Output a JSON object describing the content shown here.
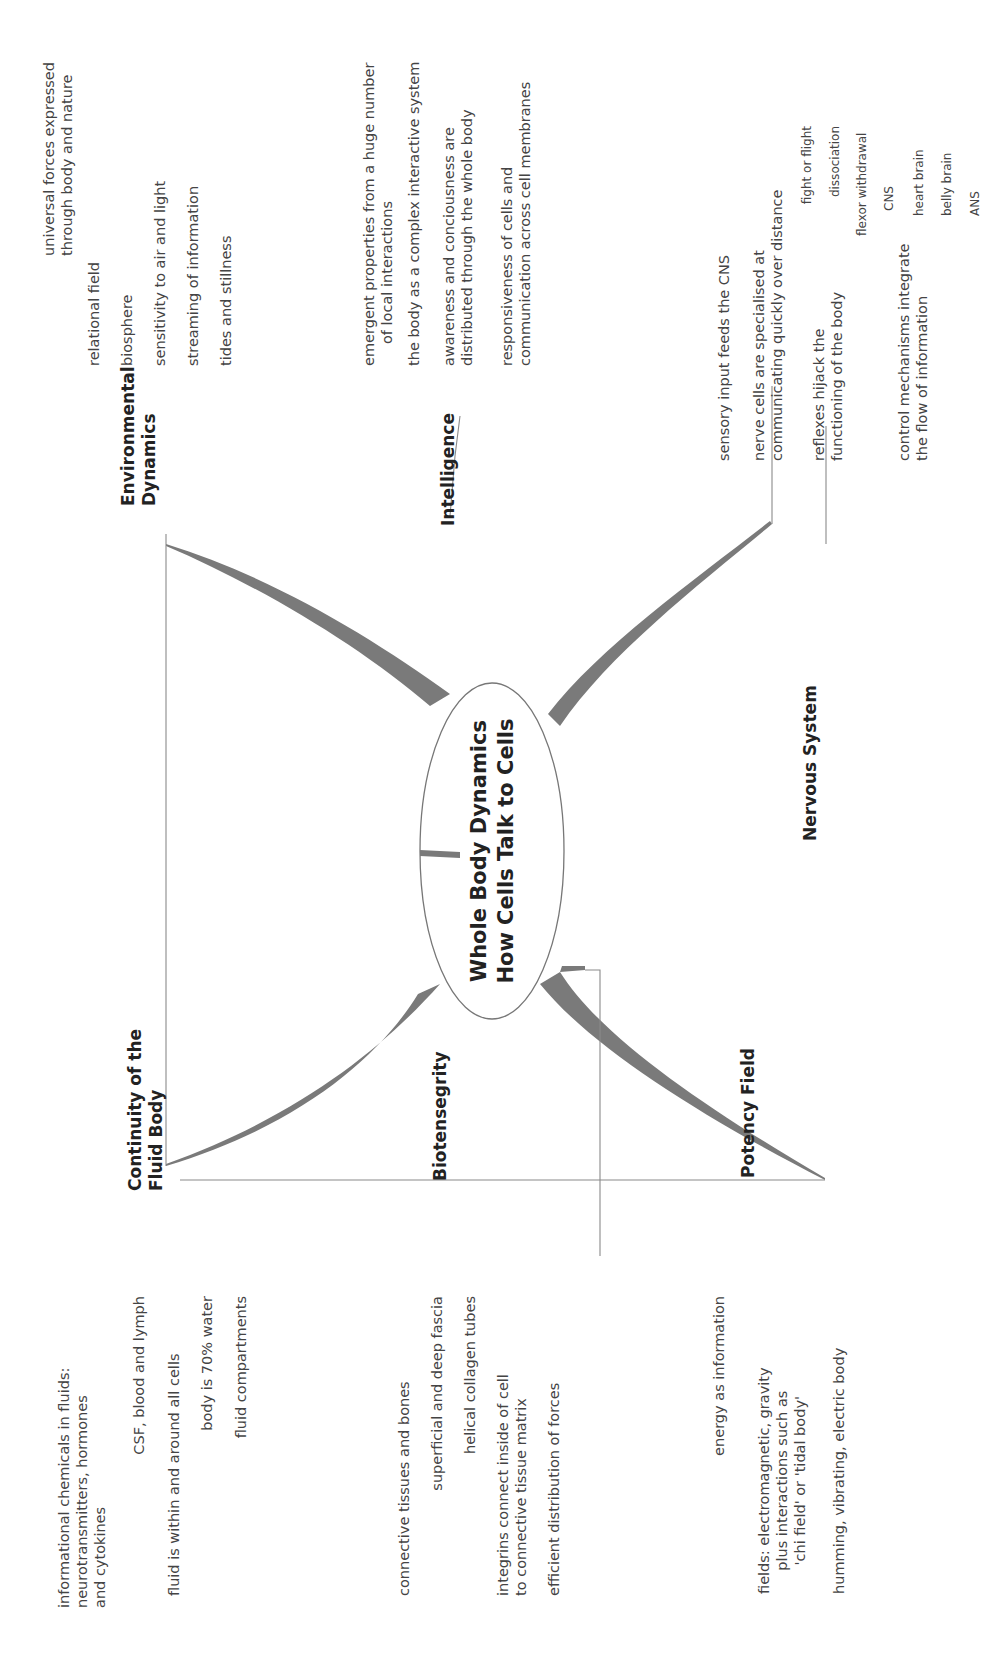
{
  "central": {
    "line1": "Whole Body Dynamics",
    "line2": "How Cells Talk to Cells"
  },
  "branches": {
    "environmental": {
      "title_l1": "Environmental",
      "title_l2": "Dynamics",
      "items": [
        {
          "l1": "universal forces expressed",
          "l2": "through body and nature"
        },
        {
          "l1": "relational field"
        },
        {
          "l1": "biosphere"
        },
        {
          "l1": "sensitivity to air and light"
        },
        {
          "l1": "streaming of information"
        },
        {
          "l1": "tides and stillness"
        }
      ]
    },
    "intelligence": {
      "title": "Intelligence",
      "items": [
        {
          "l1": "emergent properties from a huge number",
          "l2": "of local interactions"
        },
        {
          "l1": "the body as a complex interactive system"
        },
        {
          "l1": "awareness and conciousness are",
          "l2": "distributed through the whole body"
        },
        {
          "l1": "responsiveness of cells and",
          "l2": "communication across cell membranes"
        }
      ]
    },
    "nervous": {
      "title": "Nervous System",
      "items": [
        {
          "l1": "sensory input feeds the CNS"
        },
        {
          "l1": "nerve cells are specialised at",
          "l2": "communicating quickly over distance"
        },
        {
          "l1": "reflexes hijack the",
          "l2": "functioning of the body",
          "children": [
            "fight or flight",
            "dissociation",
            "flexor withdrawal"
          ]
        },
        {
          "l1": "control mechanisms integrate",
          "l2": "the flow of information",
          "children": [
            "CNS",
            "heart brain",
            "belly brain",
            "ANS"
          ]
        }
      ]
    },
    "fluid": {
      "title_l1": "Continuity of the",
      "title_l2": "Fluid Body",
      "items": [
        {
          "l1": "informational chemicals in fluids:",
          "l2": "neurotransmitters, hormones",
          "l3": "and cytokines"
        },
        {
          "l1": "CSF, blood and lymph"
        },
        {
          "l1": "fluid is within and around all cells"
        },
        {
          "l1": "body is 70% water"
        },
        {
          "l1": "fluid compartments"
        }
      ]
    },
    "biotensegrity": {
      "title": "Biotensegrity",
      "items": [
        {
          "l1": "connective tissues and bones"
        },
        {
          "l1": "superficial and deep fascia"
        },
        {
          "l1": "helical collagen tubes"
        },
        {
          "l1": "integrins connect inside of cell",
          "l2": "to connective tissue matrix"
        },
        {
          "l1": "efficient distribution of forces"
        }
      ]
    },
    "potency": {
      "title": "Potency Field",
      "items": [
        {
          "l1": "energy as information"
        },
        {
          "l1": "fields: electromagnetic, gravity",
          "l2": "plus interactions such as",
          "l3": "'chi field' or 'tidal body'"
        },
        {
          "l1": "humming, vibrating, electric body"
        }
      ]
    }
  },
  "colors": {
    "line": "#8a8a8a",
    "trunk": "#7a7a7a",
    "text": "#444444",
    "title": "#222222"
  }
}
